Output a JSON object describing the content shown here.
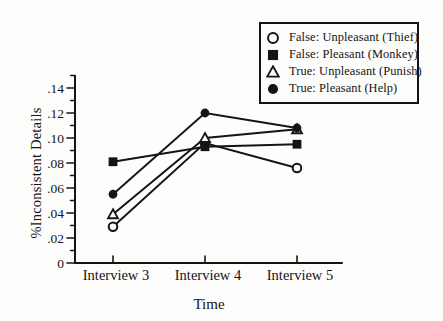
{
  "figure": {
    "background": "#fdfdfb",
    "ink": "#141414"
  },
  "chart_data": {
    "type": "line",
    "title": "",
    "xlabel": "Time",
    "ylabel": "%Inconsistent Details",
    "categories": [
      "Interview 3",
      "Interview 4",
      "Interview 5"
    ],
    "ylim": [
      0,
      0.15
    ],
    "grid": false,
    "legend_position": "top-right",
    "yticks": {
      "labels": [
        "0",
        ".02",
        ".04",
        ".06",
        ".08",
        ".10",
        ".12",
        ".14"
      ],
      "values": [
        0,
        0.02,
        0.04,
        0.06,
        0.08,
        0.1,
        0.12,
        0.14
      ],
      "minor": [
        0.01,
        0.03,
        0.05,
        0.07,
        0.09,
        0.11,
        0.13,
        0.15
      ]
    },
    "series": [
      {
        "name": "False: Unpleasant (Thief)",
        "marker": "open-circle",
        "values": [
          0.029,
          0.096,
          0.076
        ]
      },
      {
        "name": "False: Pleasant (Monkey)",
        "marker": "filled-square",
        "values": [
          0.081,
          0.093,
          0.095
        ]
      },
      {
        "name": "True: Unpleasant (Punish)",
        "marker": "open-triangle",
        "values": [
          0.039,
          0.1,
          0.107
        ]
      },
      {
        "name": "True: Pleasant (Help)",
        "marker": "filled-circle",
        "values": [
          0.055,
          0.12,
          0.108
        ]
      }
    ]
  }
}
